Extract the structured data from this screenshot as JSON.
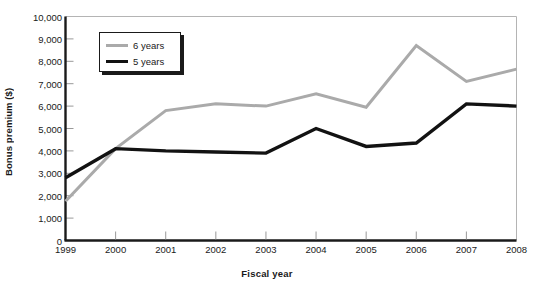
{
  "chart_data": {
    "type": "line",
    "title": "",
    "xlabel": "Fiscal year",
    "ylabel": "Bonus premium ($)",
    "categories": [
      "1999",
      "2000",
      "2001",
      "2002",
      "2003",
      "2004",
      "2005",
      "2006",
      "2007",
      "2008"
    ],
    "x": [
      1999,
      2000,
      2001,
      2002,
      2003,
      2004,
      2005,
      2006,
      2007,
      2008
    ],
    "ylim": [
      0,
      10000
    ],
    "xlim": [
      1999,
      2008
    ],
    "yticks": [
      0,
      1000,
      2000,
      3000,
      4000,
      5000,
      6000,
      7000,
      8000,
      9000,
      10000
    ],
    "ytick_labels": [
      "0",
      "1,000",
      "2,000",
      "3,000",
      "4,000",
      "5,000",
      "6,000",
      "7,000",
      "8,000",
      "9,000",
      "10,000"
    ],
    "grid": false,
    "legend_position": "top-left",
    "series": [
      {
        "name": "6 years",
        "color": "#aaaaaa",
        "values": [
          1750,
          4100,
          5800,
          6100,
          6000,
          6550,
          5950,
          8700,
          7100,
          7650
        ]
      },
      {
        "name": "5 years",
        "color": "#121212",
        "values": [
          2800,
          4100,
          4000,
          3950,
          3900,
          5000,
          4200,
          4350,
          6100,
          6000
        ]
      }
    ]
  },
  "axes": {
    "ylabel": "Bonus premium ($)",
    "xlabel": "Fiscal year"
  },
  "legend": {
    "items": [
      {
        "label": "6 years",
        "swatch": "gray"
      },
      {
        "label": "5 years",
        "swatch": "black"
      }
    ]
  },
  "colors": {
    "series_6_years": "#aaaaaa",
    "series_5_years": "#121212",
    "axis": "#1a1a1a",
    "frame": "#b4b4b4",
    "background": "#ffffff"
  }
}
